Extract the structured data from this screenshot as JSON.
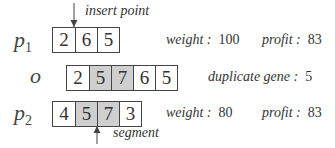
{
  "diagram": {
    "annotations": {
      "insert_point": "insert point",
      "segment": "segment"
    },
    "rows": [
      {
        "id": "p1",
        "label": "p",
        "subscript": "1",
        "genes": [
          {
            "value": "2",
            "shaded": false
          },
          {
            "value": "6",
            "shaded": false
          },
          {
            "value": "5",
            "shaded": false
          }
        ],
        "stats": [
          {
            "key": "weight :",
            "value": "100"
          },
          {
            "key": "profit :",
            "value": "83"
          }
        ]
      },
      {
        "id": "o",
        "label": "o",
        "subscript": "",
        "genes": [
          {
            "value": "2",
            "shaded": false
          },
          {
            "value": "5",
            "shaded": true
          },
          {
            "value": "7",
            "shaded": true
          },
          {
            "value": "6",
            "shaded": false
          },
          {
            "value": "5",
            "shaded": false
          }
        ],
        "stats": [
          {
            "key": "duplicate gene :",
            "value": "5"
          }
        ]
      },
      {
        "id": "p2",
        "label": "p",
        "subscript": "2",
        "genes": [
          {
            "value": "4",
            "shaded": false
          },
          {
            "value": "5",
            "shaded": true
          },
          {
            "value": "7",
            "shaded": true
          },
          {
            "value": "3",
            "shaded": false
          }
        ],
        "stats": [
          {
            "key": "weight :",
            "value": "80"
          },
          {
            "key": "profit :",
            "value": "83"
          }
        ]
      }
    ],
    "colors": {
      "shaded_cell": "#cfcfcf",
      "border": "#444444",
      "text": "#333333"
    }
  }
}
